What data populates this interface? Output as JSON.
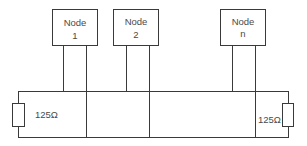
{
  "diagram": {
    "type": "bus-topology",
    "nodes": [
      {
        "line1": "Node",
        "line2": "1"
      },
      {
        "line1": "Node",
        "line2": "2"
      },
      {
        "line1": "Node",
        "line2": "n"
      }
    ],
    "terminators": [
      {
        "side": "left",
        "label": "125Ω"
      },
      {
        "side": "right",
        "label": "125Ω"
      }
    ],
    "colors": {
      "line": "#3a3a3a",
      "text": "#4a4a4a",
      "background": "#ffffff"
    }
  }
}
